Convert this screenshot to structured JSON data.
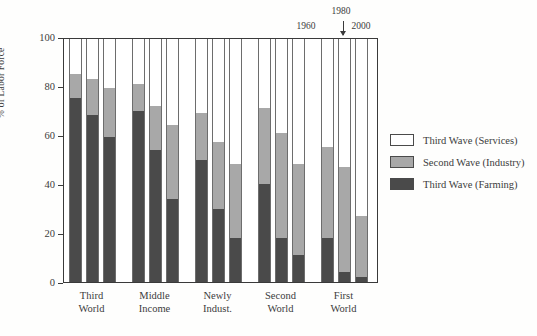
{
  "chart_data": {
    "type": "bar",
    "subtype": "stacked-bar-grouped",
    "title": "",
    "xlabel": "",
    "ylabel": "% of Labor Force",
    "ylim": [
      0,
      100
    ],
    "yticks": [
      0,
      20,
      40,
      60,
      80,
      100
    ],
    "grid": false,
    "legend_position": "right",
    "series_order": [
      "Third Wave (Services)",
      "Second Wave (Industry)",
      "Third Wave (Farming)"
    ],
    "bar_group_years": [
      "1960",
      "1980",
      "2000"
    ],
    "categories": [
      "Third World",
      "Middle Income",
      "Newly Indust.",
      "Second World",
      "First World"
    ],
    "series": [
      {
        "name": "Third Wave (Farming)",
        "color": "#4a4a4a",
        "values": [
          [
            75,
            68,
            59
          ],
          [
            70,
            54,
            34
          ],
          [
            50,
            30,
            18
          ],
          [
            40,
            18,
            11
          ],
          [
            18,
            4,
            2
          ]
        ]
      },
      {
        "name": "Second Wave (Industry)",
        "color": "#a8a8a8",
        "values": [
          [
            10,
            15,
            20
          ],
          [
            11,
            18,
            30
          ],
          [
            19,
            27,
            30
          ],
          [
            31,
            43,
            37
          ],
          [
            37,
            43,
            25
          ]
        ]
      },
      {
        "name": "Third Wave (Services)",
        "color": "#ffffff",
        "values": [
          [
            15,
            17,
            21
          ],
          [
            19,
            28,
            36
          ],
          [
            31,
            43,
            52
          ],
          [
            29,
            39,
            52
          ],
          [
            45,
            53,
            73
          ]
        ]
      }
    ],
    "cumulative_tops": {
      "farming": [
        [
          75,
          68,
          59
        ],
        [
          70,
          54,
          34
        ],
        [
          50,
          30,
          18
        ],
        [
          40,
          18,
          11
        ],
        [
          18,
          4,
          2
        ]
      ],
      "farming_plus_industry": [
        [
          85,
          83,
          79
        ],
        [
          81,
          72,
          64
        ],
        [
          69,
          57,
          48
        ],
        [
          71,
          61,
          48
        ],
        [
          55,
          47,
          27
        ]
      ]
    },
    "annotations": [
      {
        "text": "1960",
        "points_to_bar": 1
      },
      {
        "text": "1980",
        "points_to_bar": 2
      },
      {
        "text": "2000",
        "points_to_bar": 3
      }
    ]
  },
  "axes": {
    "y_title": "% of Labor Force",
    "y_tick_labels": [
      "100",
      "80",
      "60",
      "40",
      "20",
      "0"
    ],
    "y_tick_values": [
      100,
      80,
      60,
      40,
      20,
      0
    ]
  },
  "groups": [
    {
      "line1": "Third",
      "line2": "World"
    },
    {
      "line1": "Middle",
      "line2": "Income"
    },
    {
      "line1": "Newly",
      "line2": "Indust."
    },
    {
      "line1": "Second",
      "line2": "World"
    },
    {
      "line1": "First",
      "line2": "World"
    }
  ],
  "year_annotation": {
    "left": "1960",
    "center": "1980",
    "right": "2000"
  },
  "legend": {
    "items": [
      {
        "label": "Third Wave (Services)",
        "color": "#ffffff",
        "swatch": "sw-services"
      },
      {
        "label": "Second Wave (Industry)",
        "color": "#a8a8a8",
        "swatch": "sw-industry"
      },
      {
        "label": "Third Wave (Farming)",
        "color": "#4a4a4a",
        "swatch": "sw-farming"
      }
    ]
  },
  "colors": {
    "services": "#ffffff",
    "industry": "#a8a8a8",
    "farming": "#4a4a4a",
    "frame": "#3a3a3a",
    "text": "#3c3c3c",
    "background": "#fefefd"
  }
}
